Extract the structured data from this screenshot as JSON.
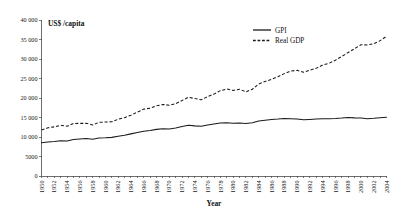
{
  "chart_data": {
    "type": "line",
    "title": "",
    "xlabel": "Year",
    "ylabel": "US$ /capita",
    "ylim": [
      0,
      40000
    ],
    "xlim": [
      1950,
      2004
    ],
    "grid": false,
    "legend_position": "top-right",
    "ytick_labels": [
      "0",
      "5000",
      "10 000",
      "15 000",
      "20 000",
      "25 000",
      "30 000",
      "35 000",
      "40 000"
    ],
    "ytick_values": [
      0,
      5000,
      10000,
      15000,
      20000,
      25000,
      30000,
      35000,
      40000
    ],
    "xtick_labels": [
      "1950",
      "1952",
      "1954",
      "1956",
      "1958",
      "1960",
      "1962",
      "1964",
      "1966",
      "1968",
      "1970",
      "1972",
      "1974",
      "1976",
      "1978",
      "1980",
      "1982",
      "1984",
      "1986",
      "1988",
      "1990",
      "1992",
      "1994",
      "1996",
      "1998",
      "2000",
      "2002",
      "2004"
    ],
    "x": [
      1950,
      1951,
      1952,
      1953,
      1954,
      1955,
      1956,
      1957,
      1958,
      1959,
      1960,
      1961,
      1962,
      1963,
      1964,
      1965,
      1966,
      1967,
      1968,
      1969,
      1970,
      1971,
      1972,
      1973,
      1974,
      1975,
      1976,
      1977,
      1978,
      1979,
      1980,
      1981,
      1982,
      1983,
      1984,
      1985,
      1986,
      1987,
      1988,
      1989,
      1990,
      1991,
      1992,
      1993,
      1994,
      1995,
      1996,
      1997,
      1998,
      1999,
      2000,
      2001,
      2002,
      2003,
      2004
    ],
    "series": [
      {
        "name": "GPI",
        "style": "solid",
        "color": "#1a1a1a",
        "values": [
          8500,
          8700,
          8850,
          9050,
          9000,
          9350,
          9500,
          9600,
          9450,
          9750,
          9800,
          9900,
          10200,
          10450,
          10800,
          11150,
          11500,
          11650,
          11950,
          12100,
          12050,
          12300,
          12700,
          13000,
          12850,
          12750,
          13100,
          13350,
          13600,
          13650,
          13500,
          13600,
          13450,
          13650,
          14100,
          14300,
          14500,
          14600,
          14750,
          14700,
          14600,
          14400,
          14500,
          14600,
          14700,
          14700,
          14750,
          14850,
          15000,
          14900,
          14850,
          14700,
          14800,
          14950,
          15050
        ]
      },
      {
        "name": "Real GDP",
        "style": "dashed",
        "color": "#1a1a1a",
        "values": [
          11800,
          12350,
          12600,
          13000,
          12750,
          13450,
          13500,
          13500,
          13100,
          13750,
          13850,
          13900,
          14550,
          14950,
          15600,
          16350,
          17150,
          17400,
          18000,
          18350,
          18150,
          18550,
          19350,
          20200,
          19850,
          19550,
          20350,
          21000,
          21900,
          22300,
          21950,
          22250,
          21550,
          22250,
          23600,
          24250,
          24800,
          25450,
          26250,
          26900,
          27100,
          26600,
          27150,
          27600,
          28450,
          28900,
          29700,
          30650,
          31650,
          32650,
          33650,
          33600,
          33900,
          34700,
          35800
        ]
      }
    ]
  },
  "legend": {
    "items": [
      {
        "label": "GPI",
        "style": "solid"
      },
      {
        "label": "Real GDP",
        "style": "dashed"
      }
    ]
  }
}
